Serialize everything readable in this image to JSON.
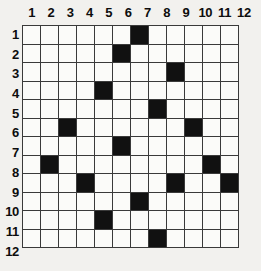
{
  "puzzle": {
    "title": "12x12 filled-cell grid",
    "rows": 12,
    "cols": 12,
    "column_headers": [
      "1",
      "2",
      "3",
      "4",
      "5",
      "6",
      "7",
      "8",
      "9",
      "10",
      "11",
      "12"
    ],
    "row_headers": [
      "1",
      "2",
      "3",
      "4",
      "5",
      "6",
      "7",
      "8",
      "9",
      "10",
      "11",
      "12"
    ],
    "colors": {
      "background": "#f2f1ee",
      "cell_empty": "#fbfbf9",
      "cell_filled": "#111111",
      "grid_line": "#3a3a3a",
      "label_text": "#0d0d0d"
    },
    "filled_cells": [
      {
        "row": 1,
        "col": 7
      },
      {
        "row": 2,
        "col": 6
      },
      {
        "row": 3,
        "col": 9
      },
      {
        "row": 4,
        "col": 5
      },
      {
        "row": 5,
        "col": 8
      },
      {
        "row": 6,
        "col": 3
      },
      {
        "row": 6,
        "col": 10
      },
      {
        "row": 7,
        "col": 6
      },
      {
        "row": 8,
        "col": 2
      },
      {
        "row": 8,
        "col": 11
      },
      {
        "row": 9,
        "col": 4
      },
      {
        "row": 9,
        "col": 9
      },
      {
        "row": 9,
        "col": 12
      },
      {
        "row": 10,
        "col": 7
      },
      {
        "row": 11,
        "col": 5
      },
      {
        "row": 12,
        "col": 8
      }
    ],
    "matrix": [
      [
        0,
        0,
        0,
        0,
        0,
        0,
        1,
        0,
        0,
        0,
        0,
        0
      ],
      [
        0,
        0,
        0,
        0,
        0,
        1,
        0,
        0,
        0,
        0,
        0,
        0
      ],
      [
        0,
        0,
        0,
        0,
        0,
        0,
        0,
        0,
        1,
        0,
        0,
        0
      ],
      [
        0,
        0,
        0,
        0,
        1,
        0,
        0,
        0,
        0,
        0,
        0,
        0
      ],
      [
        0,
        0,
        0,
        0,
        0,
        0,
        0,
        1,
        0,
        0,
        0,
        0
      ],
      [
        0,
        0,
        1,
        0,
        0,
        0,
        0,
        0,
        0,
        1,
        0,
        0
      ],
      [
        0,
        0,
        0,
        0,
        0,
        1,
        0,
        0,
        0,
        0,
        0,
        0
      ],
      [
        0,
        1,
        0,
        0,
        0,
        0,
        0,
        0,
        0,
        0,
        1,
        0
      ],
      [
        0,
        0,
        0,
        1,
        0,
        0,
        0,
        0,
        1,
        0,
        0,
        1
      ],
      [
        0,
        0,
        0,
        0,
        0,
        0,
        1,
        0,
        0,
        0,
        0,
        0
      ],
      [
        0,
        0,
        0,
        0,
        1,
        0,
        0,
        0,
        0,
        0,
        0,
        0
      ],
      [
        0,
        0,
        0,
        0,
        0,
        0,
        0,
        1,
        0,
        0,
        0,
        0
      ]
    ]
  }
}
